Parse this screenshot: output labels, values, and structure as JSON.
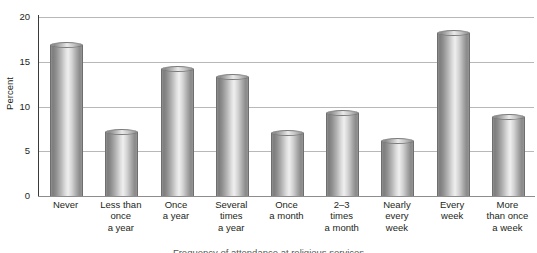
{
  "chart_data": {
    "type": "bar",
    "title": "",
    "xlabel": "",
    "ylabel": "Percent",
    "ylim": [
      0,
      20
    ],
    "yticks": [
      0,
      5,
      10,
      15,
      20
    ],
    "grid": "horizontal",
    "legend": "none",
    "categories": [
      "Never",
      "Less than once a year",
      "Once a year",
      "Several times a year",
      "Once a month",
      "2–3 times a month",
      "Nearly every week",
      "Every week",
      "More than once a week"
    ],
    "category_lines": [
      [
        "Never"
      ],
      [
        "Less than",
        "once",
        "a year"
      ],
      [
        "Once",
        "a year"
      ],
      [
        "Several",
        "times",
        "a year"
      ],
      [
        "Once",
        "a month"
      ],
      [
        "2–3",
        "times",
        "a month"
      ],
      [
        "Nearly",
        "every",
        "week"
      ],
      [
        "Every",
        "week"
      ],
      [
        "More",
        "than once",
        "a week"
      ]
    ],
    "values": [
      16.9,
      7.2,
      14.2,
      13.3,
      7.0,
      9.3,
      6.1,
      18.2,
      8.8
    ],
    "series": [
      {
        "name": "Percent",
        "values": [
          16.9,
          7.2,
          14.2,
          13.3,
          7.0,
          9.3,
          6.1,
          18.2,
          8.8
        ]
      }
    ]
  },
  "axis": {
    "y_title": "Percent",
    "y_ticks": [
      "20",
      "15",
      "10",
      "5",
      "0"
    ]
  },
  "caption": {
    "text": "Frequency of attendance at religious services"
  },
  "colors": {
    "bar_light": "#efefef",
    "bar_mid": "#b5b5b5",
    "bar_dark": "#7d7d7d",
    "gridline": "#b8b8b8",
    "axis": "#3a3a3a",
    "text": "#231f20",
    "background": "#ffffff"
  }
}
